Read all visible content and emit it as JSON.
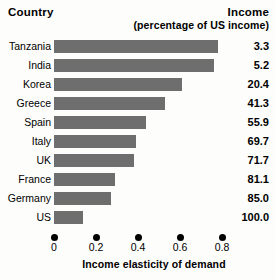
{
  "header": {
    "country_label": "Country",
    "income_label": "Income",
    "income_sub_label": "(percentage of US income)"
  },
  "axis": {
    "x_title": "Income elasticity of demand",
    "ticks": [
      "0",
      "0.2",
      "0.4",
      "0.6",
      "0.8"
    ]
  },
  "colors": {
    "bar": "#6e6e6e",
    "text": "#000000",
    "background": "#fdfdfb"
  },
  "chart_data": {
    "type": "bar",
    "orientation": "horizontal",
    "title": "",
    "xlabel": "Income elasticity of demand",
    "ylabel": "Country",
    "xlim": [
      0,
      0.85
    ],
    "grid": false,
    "legend": false,
    "categories": [
      "Tanzania",
      "India",
      "Korea",
      "Greece",
      "Spain",
      "Italy",
      "UK",
      "France",
      "Germany",
      "US"
    ],
    "values": [
      0.78,
      0.76,
      0.61,
      0.53,
      0.44,
      0.39,
      0.38,
      0.29,
      0.27,
      0.14
    ],
    "series": [
      {
        "name": "Income elasticity of demand",
        "values": [
          0.78,
          0.76,
          0.61,
          0.53,
          0.44,
          0.39,
          0.38,
          0.29,
          0.27,
          0.14
        ]
      },
      {
        "name": "Income (percentage of US income)",
        "values": [
          3.3,
          5.2,
          20.4,
          41.3,
          55.9,
          69.7,
          71.7,
          81.1,
          85.0,
          100.0
        ]
      }
    ],
    "value_labels": [
      "3.3",
      "5.2",
      "20.4",
      "41.3",
      "55.9",
      "69.7",
      "71.7",
      "81.1",
      "85.0",
      "100.0"
    ],
    "xticks": [
      0,
      0.2,
      0.4,
      0.6,
      0.8
    ],
    "xticklabels": [
      "0",
      "0.2",
      "0.4",
      "0.6",
      "0.8"
    ]
  }
}
